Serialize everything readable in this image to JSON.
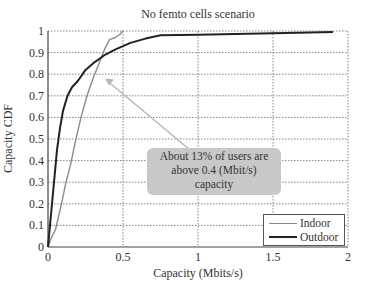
{
  "chart_data": {
    "type": "line",
    "title": "No femto cells scenario",
    "xlabel": "Capacity (Mbits/s)",
    "ylabel": "Capacity CDF",
    "xlim": [
      0,
      2
    ],
    "ylim": [
      0,
      1
    ],
    "xticks": [
      "0",
      "0.5",
      "1",
      "1.5",
      "2"
    ],
    "yticks": [
      "0",
      "0.1",
      "0.2",
      "0.3",
      "0.4",
      "0.5",
      "0.6",
      "0.7",
      "0.8",
      "0.9",
      "1"
    ],
    "grid": true,
    "legend_position": "lower right",
    "series": [
      {
        "name": "Indoor",
        "color": "#8a8a8a",
        "x": [
          0,
          0.02,
          0.05,
          0.09,
          0.12,
          0.15,
          0.18,
          0.22,
          0.26,
          0.3,
          0.34,
          0.38,
          0.41,
          0.45,
          0.48,
          0.5
        ],
        "y": [
          0,
          0.04,
          0.08,
          0.2,
          0.3,
          0.38,
          0.48,
          0.6,
          0.7,
          0.78,
          0.85,
          0.92,
          0.96,
          0.97,
          0.985,
          1.0
        ]
      },
      {
        "name": "Outdoor",
        "color": "#222222",
        "x": [
          0,
          0.02,
          0.04,
          0.06,
          0.08,
          0.1,
          0.13,
          0.16,
          0.2,
          0.25,
          0.3,
          0.38,
          0.45,
          0.55,
          0.65,
          0.75,
          1.0,
          1.5,
          1.9
        ],
        "y": [
          0,
          0.15,
          0.3,
          0.45,
          0.55,
          0.63,
          0.7,
          0.74,
          0.77,
          0.82,
          0.85,
          0.89,
          0.915,
          0.945,
          0.965,
          0.98,
          0.983,
          0.99,
          0.995
        ]
      }
    ],
    "annotations": [
      {
        "text_lines": [
          "About 13% of users are",
          "above 0.4 (Mbit/s)",
          "capacity"
        ],
        "arrow_to": [
          0.38,
          0.78
        ]
      }
    ]
  }
}
